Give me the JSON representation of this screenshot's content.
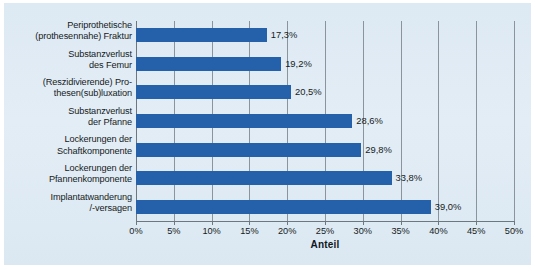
{
  "chart_data": {
    "type": "bar",
    "orientation": "horizontal",
    "title": "",
    "xlabel": "Anteil",
    "ylabel": "",
    "xlim": [
      0,
      50
    ],
    "xticks": [
      "0%",
      "5%",
      "10%",
      "15%",
      "20%",
      "25%",
      "30%",
      "35%",
      "40%",
      "45%",
      "50%"
    ],
    "xtick_values": [
      0,
      5,
      10,
      15,
      20,
      25,
      30,
      35,
      40,
      45,
      50
    ],
    "grid": true,
    "legend": "none",
    "bar_color": "#2560ab",
    "background_color": "#dfeaf3",
    "categories": [
      "Periprothetische (prothesennahe) Fraktur",
      "Substanzverlust des Femur",
      "(Reszidivierende) Prothesen(sub)luxation",
      "Substanzverlust der Pfanne",
      "Lockerungen der Schaftkomponente",
      "Lockerungen der Pfannenkomponente",
      "Implantatwanderung /-versagen"
    ],
    "category_lines": [
      [
        "Periprothetische",
        "(prothesennahe) Fraktur"
      ],
      [
        "Substanzverlust",
        "des Femur"
      ],
      [
        "(Reszidivierende) Pro-",
        "thesen(sub)luxation"
      ],
      [
        "Substanzverlust",
        "der Pfanne"
      ],
      [
        "Lockerungen der",
        "Schaftkomponente"
      ],
      [
        "Lockerungen der",
        "Pfannenkomponente"
      ],
      [
        "Implantatwanderung",
        "/-versagen"
      ]
    ],
    "values": [
      17.3,
      19.2,
      20.5,
      28.6,
      29.8,
      33.8,
      39.0
    ],
    "value_labels": [
      "17,3%",
      "19,2%",
      "20,5%",
      "28,6%",
      "29,8%",
      "33,8%",
      "39,0%"
    ]
  }
}
